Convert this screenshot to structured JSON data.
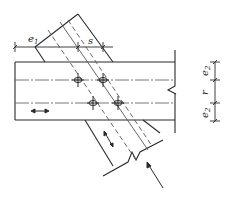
{
  "diagram": {
    "type": "bolted-plate-connection",
    "colors": {
      "line": "#2a2a2a",
      "dash": "#555555",
      "background": "#ffffff"
    },
    "labels": {
      "e1": "e",
      "e1_sub": "1",
      "s": "s",
      "e2_top": "e",
      "e2_top_sub": "2",
      "r": "r",
      "e2_bottom": "e",
      "e2_bottom_sub": "2"
    },
    "bolts": [
      {
        "x": 78,
        "y": 80
      },
      {
        "x": 103,
        "y": 80
      },
      {
        "x": 93,
        "y": 103
      },
      {
        "x": 118,
        "y": 103
      }
    ],
    "icons": {
      "member_force_arrow": "double-headed-arrow-horizontal",
      "plate_force_arrow": "double-headed-arrow-diagonal",
      "load_arrow": "arrow-up-left"
    }
  }
}
